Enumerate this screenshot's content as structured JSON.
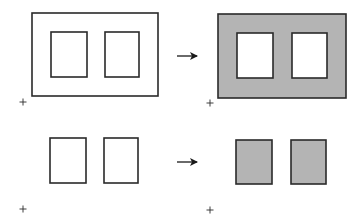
{
  "colors": {
    "stroke": "#2a2a2a",
    "fill_gray": "#b4b4b4",
    "background": "#ffffff"
  },
  "diagram": {
    "rows": [
      {
        "name": "top-row",
        "left": {
          "outer": {
            "x": 32,
            "y": 13,
            "w": 126,
            "h": 83,
            "filled": false
          },
          "holes": [
            {
              "x": 51,
              "y": 32,
              "w": 36,
              "h": 45,
              "filled": false
            },
            {
              "x": 105,
              "y": 32,
              "w": 34,
              "h": 45,
              "filled": false
            }
          ],
          "origin_marker": {
            "x": 23,
            "y": 102,
            "glyph": "+"
          }
        },
        "arrow": {
          "x1": 177,
          "y1": 56,
          "x2": 197,
          "y2": 56
        },
        "right": {
          "outer": {
            "x": 218,
            "y": 14,
            "w": 128,
            "h": 84,
            "filled": true
          },
          "holes": [
            {
              "x": 237,
              "y": 33,
              "w": 36,
              "h": 45,
              "filled": false
            },
            {
              "x": 292,
              "y": 33,
              "w": 35,
              "h": 45,
              "filled": false
            }
          ],
          "origin_marker": {
            "x": 210,
            "y": 103,
            "glyph": "+"
          }
        }
      },
      {
        "name": "bottom-row",
        "left": {
          "holes": [
            {
              "x": 50,
              "y": 138,
              "w": 36,
              "h": 45,
              "filled": false
            },
            {
              "x": 104,
              "y": 138,
              "w": 34,
              "h": 45,
              "filled": false
            }
          ],
          "origin_marker": {
            "x": 23,
            "y": 209,
            "glyph": "+"
          }
        },
        "arrow": {
          "x1": 177,
          "y1": 162,
          "x2": 197,
          "y2": 162
        },
        "right": {
          "holes": [
            {
              "x": 236,
              "y": 140,
              "w": 36,
              "h": 44,
              "filled": true
            },
            {
              "x": 291,
              "y": 140,
              "w": 35,
              "h": 44,
              "filled": true
            }
          ],
          "origin_marker": {
            "x": 210,
            "y": 210,
            "glyph": "+"
          }
        }
      }
    ]
  }
}
